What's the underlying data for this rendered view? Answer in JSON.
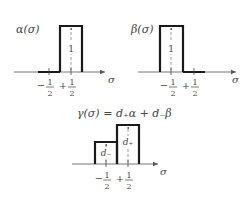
{
  "panels": {
    "alpha": {
      "title": "α(σ)",
      "height_label": "1",
      "axis_label": "σ",
      "ticks": {
        "minus": "−",
        "plus": "+",
        "numerator": "1",
        "denominator": "2"
      }
    },
    "beta": {
      "title": "β(σ)",
      "height_label": "1",
      "axis_label": "σ",
      "ticks": {
        "minus": "−",
        "plus": "+",
        "numerator": "1",
        "denominator": "2"
      }
    },
    "gamma": {
      "title": "γ(σ) = d₊α + d₋β",
      "left_height_label": "d₋",
      "right_height_label": "d₊",
      "axis_label": "σ",
      "ticks": {
        "minus": "−",
        "plus": "+",
        "numerator": "1",
        "denominator": "2"
      }
    }
  },
  "colors": {
    "stroke": "#1a1a1a",
    "axis": "#666666",
    "text": "#444444"
  }
}
